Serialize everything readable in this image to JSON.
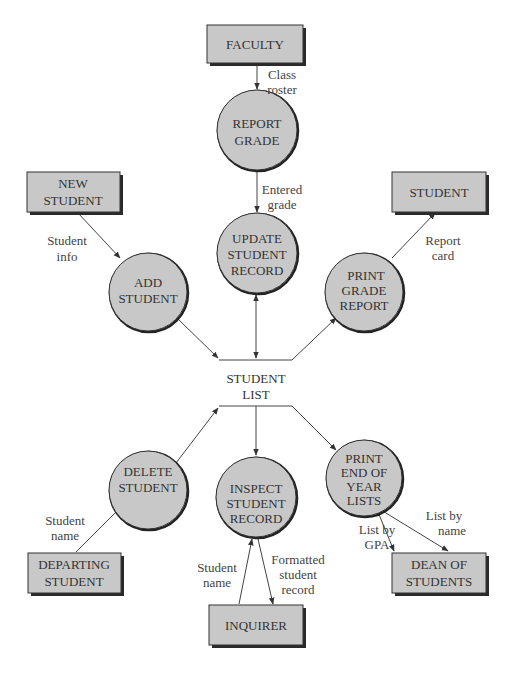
{
  "colors": {
    "shape_fill": "#c8c8c8",
    "stroke": "#333333",
    "background": "#ffffff"
  },
  "external_entities": {
    "faculty": {
      "lines": [
        "FACULTY"
      ]
    },
    "new_student": {
      "lines": [
        "NEW",
        "STUDENT"
      ]
    },
    "student": {
      "lines": [
        "STUDENT"
      ]
    },
    "departing_student": {
      "lines": [
        "DEPARTING",
        "STUDENT"
      ]
    },
    "inquirer": {
      "lines": [
        "INQUIRER"
      ]
    },
    "dean_of_students": {
      "lines": [
        "DEAN OF",
        "STUDENTS"
      ]
    }
  },
  "processes": {
    "report_grade": {
      "lines": [
        "REPORT",
        "GRADE"
      ]
    },
    "update_student_record": {
      "lines": [
        "UPDATE",
        "STUDENT",
        "RECORD"
      ]
    },
    "add_student": {
      "lines": [
        "ADD",
        "STUDENT"
      ]
    },
    "print_grade_report": {
      "lines": [
        "PRINT",
        "GRADE",
        "REPORT"
      ]
    },
    "delete_student": {
      "lines": [
        "DELETE",
        "STUDENT"
      ]
    },
    "inspect_student_record": {
      "lines": [
        "INSPECT",
        "STUDENT",
        "RECORD"
      ]
    },
    "print_end_of_year_lists": {
      "lines": [
        "PRINT",
        "END OF",
        "YEAR",
        "LISTS"
      ]
    }
  },
  "data_store": {
    "lines": [
      "STUDENT",
      "LIST"
    ]
  },
  "data_flows": {
    "class_roster": {
      "lines": [
        "Class",
        "roster"
      ]
    },
    "entered_grade": {
      "lines": [
        "Entered",
        "grade"
      ]
    },
    "student_info": {
      "lines": [
        "Student",
        "info"
      ]
    },
    "report_card": {
      "lines": [
        "Report",
        "card"
      ]
    },
    "student_name_departing": {
      "lines": [
        "Student",
        "name"
      ]
    },
    "student_name_inquirer": {
      "lines": [
        "Student",
        "name"
      ]
    },
    "formatted_student_record": {
      "lines": [
        "Formatted",
        "student",
        "record"
      ]
    },
    "list_by_gpa": {
      "lines": [
        "List by",
        "GPA"
      ]
    },
    "list_by_name": {
      "lines": [
        "List by",
        "name"
      ]
    }
  }
}
